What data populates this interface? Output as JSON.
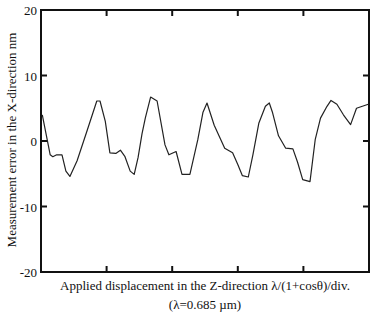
{
  "chart_data": {
    "type": "line",
    "title": "",
    "xlabel": "Applied displacement in the Z-direction λ/(1+cosθ)/div.",
    "xlabel_sub": "(λ=0.685 µm)",
    "ylabel": "Measurement error in the X-direction nm",
    "ylim": [
      -20,
      20
    ],
    "xlim": [
      0,
      5
    ],
    "yticks": [
      -20,
      -10,
      0,
      10,
      20
    ],
    "ytick_labels": [
      "-20",
      "-10",
      "0",
      "10",
      "20"
    ],
    "xticks": [
      1,
      2,
      3,
      4
    ],
    "xtick_labels": [],
    "grid": false,
    "legend": null,
    "series": [
      {
        "name": "Measurement error",
        "color": "#222222",
        "x": [
          0.02,
          0.14,
          0.18,
          0.24,
          0.32,
          0.38,
          0.44,
          0.55,
          0.7,
          0.85,
          0.9,
          0.98,
          1.05,
          1.14,
          1.21,
          1.28,
          1.36,
          1.42,
          1.48,
          1.54,
          1.59,
          1.67,
          1.77,
          1.89,
          1.95,
          2.06,
          2.15,
          2.27,
          2.39,
          2.47,
          2.53,
          2.64,
          2.8,
          2.92,
          3.0,
          3.07,
          3.16,
          3.23,
          3.32,
          3.42,
          3.48,
          3.53,
          3.62,
          3.73,
          3.84,
          3.91,
          3.99,
          4.1,
          4.18,
          4.26,
          4.36,
          4.42,
          4.51,
          4.61,
          4.72,
          4.81,
          4.99
        ],
        "y": [
          4.0,
          -2.1,
          -2.4,
          -2.1,
          -2.1,
          -4.6,
          -5.4,
          -3.0,
          1.5,
          6.1,
          6.1,
          3.0,
          -1.8,
          -1.9,
          -1.4,
          -2.4,
          -4.6,
          -5.1,
          -2.5,
          1.1,
          3.5,
          6.7,
          6.1,
          -0.6,
          -2.1,
          -1.6,
          -5.1,
          -5.1,
          0.2,
          4.4,
          5.8,
          2.4,
          -1.1,
          -1.8,
          -3.6,
          -5.3,
          -5.5,
          -2.1,
          2.7,
          5.3,
          5.8,
          4.3,
          0.8,
          -1.1,
          -1.2,
          -3.2,
          -5.9,
          -6.2,
          0.2,
          3.5,
          5.3,
          6.2,
          5.6,
          4.0,
          2.5,
          5.0,
          5.6
        ]
      }
    ]
  },
  "axes": {
    "ytick_labels": [
      "20",
      "10",
      "0",
      "-10",
      "-20"
    ]
  }
}
